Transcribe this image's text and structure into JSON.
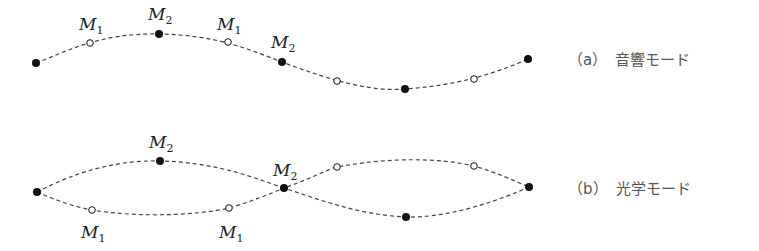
{
  "diagram": {
    "colors": {
      "line": "#444444",
      "filled": "#111111",
      "open_fill": "#ffffff"
    },
    "panels": [
      {
        "id": "a",
        "caption": "（a）　音響モード",
        "caption_pos": [
          568,
          48
        ],
        "curves": [
          "M36,63 C 70,50 100,33 159,34 C 218,35 250,50 282,62 C 330,80 370,92 405,89 C 450,86 490,76 528,59"
        ],
        "points": [
          {
            "x": 36,
            "y": 63,
            "type": "filled"
          },
          {
            "x": 90,
            "y": 43,
            "type": "open"
          },
          {
            "x": 159,
            "y": 34,
            "type": "filled"
          },
          {
            "x": 228,
            "y": 42,
            "type": "open"
          },
          {
            "x": 282,
            "y": 62,
            "type": "filled"
          },
          {
            "x": 337,
            "y": 81,
            "type": "open"
          },
          {
            "x": 405,
            "y": 89,
            "type": "filled"
          },
          {
            "x": 474,
            "y": 79,
            "type": "open"
          },
          {
            "x": 528,
            "y": 59,
            "type": "filled"
          }
        ],
        "labels": [
          {
            "text": "M",
            "sub": "1",
            "x": 79,
            "y": 30
          },
          {
            "text": "M",
            "sub": "2",
            "x": 148,
            "y": 20
          },
          {
            "text": "M",
            "sub": "1",
            "x": 217,
            "y": 30
          },
          {
            "text": "M",
            "sub": "2",
            "x": 271,
            "y": 48
          }
        ]
      },
      {
        "id": "b",
        "caption": "（b）　光学モード",
        "caption_pos": [
          568,
          177
        ],
        "curves": [
          "M37,192 C 70,175 110,160 160,161 C 215,162 255,178 284,188 C 320,175 330,168 337,167 C 390,157 440,158 474,166 C 495,172 515,181 529,187",
          "M37,192 C 55,200 75,207 92,210 C 140,218 200,215 229,208 C 250,202 270,194 284,188 C 320,200 360,215 406,217 C 450,218 500,200 529,187"
        ],
        "points": [
          {
            "x": 37,
            "y": 192,
            "type": "filled"
          },
          {
            "x": 160,
            "y": 161,
            "type": "filled"
          },
          {
            "x": 92,
            "y": 210,
            "type": "open"
          },
          {
            "x": 229,
            "y": 208,
            "type": "open"
          },
          {
            "x": 284,
            "y": 188,
            "type": "filled"
          },
          {
            "x": 337,
            "y": 167,
            "type": "open"
          },
          {
            "x": 474,
            "y": 166,
            "type": "open"
          },
          {
            "x": 406,
            "y": 217,
            "type": "filled"
          },
          {
            "x": 529,
            "y": 187,
            "type": "filled"
          }
        ],
        "labels": [
          {
            "text": "M",
            "sub": "2",
            "x": 149,
            "y": 148
          },
          {
            "text": "M",
            "sub": "2",
            "x": 273,
            "y": 176
          },
          {
            "text": "M",
            "sub": "1",
            "x": 81,
            "y": 238
          },
          {
            "text": "M",
            "sub": "1",
            "x": 219,
            "y": 238
          }
        ]
      }
    ]
  }
}
